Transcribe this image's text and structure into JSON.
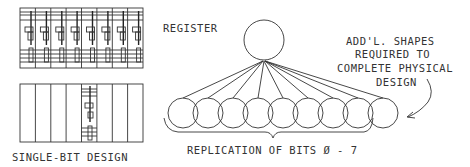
{
  "diagram": {
    "labels": {
      "register": "REGISTER",
      "single_bit_design": "SINGLE-BIT DESIGN",
      "replication": "REPLICATION OF BITS Ø - 7",
      "note_line1": "ADD'L. SHAPES",
      "note_line2": "REQUIRED TO",
      "note_line3": "COMPLETE PHYSICAL",
      "note_line4": "DESIGN"
    },
    "register_node": {
      "cx": 264,
      "cy": 40,
      "r": 20
    },
    "bit_nodes": {
      "count": 9,
      "cy": 113,
      "r": 15,
      "centers_x": [
        183,
        208,
        233,
        258,
        283,
        308,
        333,
        358,
        383
      ]
    },
    "layout_blocks": {
      "replicated_layout": {
        "columns": 8,
        "x": 20,
        "y": 8,
        "width": 123,
        "height": 60
      },
      "single_bit_layout": {
        "columns": 8,
        "highlighted_column": 5,
        "x": 20,
        "y": 84,
        "width": 123,
        "height": 58
      }
    },
    "colors": {
      "line": "#333333",
      "background": "#ffffff"
    }
  }
}
